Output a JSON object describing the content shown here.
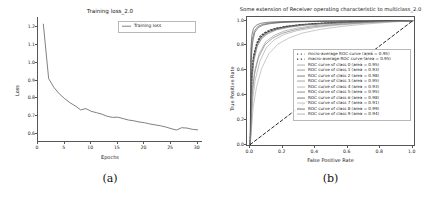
{
  "figure": {
    "panels": [
      {
        "caption": "(a)",
        "chart_data": {
          "type": "line",
          "title": "Training loss_2.0",
          "xlabel": "Epochs",
          "ylabel": "Loss",
          "xlim": [
            0,
            31
          ],
          "ylim": [
            0.55,
            1.25
          ],
          "xticks": [
            "0",
            "5",
            "10",
            "15",
            "20",
            "25",
            "30"
          ],
          "xtick_values": [
            0,
            5,
            10,
            15,
            20,
            25,
            30
          ],
          "yticks": [
            "0.6",
            "0.7",
            "0.8",
            "0.9",
            "1.0",
            "1.1",
            "1.2"
          ],
          "ytick_values": [
            0.6,
            0.7,
            0.8,
            0.9,
            1.0,
            1.1,
            1.2
          ],
          "grid": false,
          "legend_position": "upper right",
          "series": [
            {
              "name": "Training loss",
              "color": "#4a4a4a",
              "x": [
                1,
                2,
                3,
                4,
                5,
                6,
                7,
                8,
                9,
                10,
                11,
                12,
                13,
                14,
                15,
                16,
                17,
                18,
                19,
                20,
                21,
                22,
                23,
                24,
                25,
                26,
                27,
                28,
                29,
                30
              ],
              "values": [
                1.21,
                0.905,
                0.855,
                0.82,
                0.793,
                0.77,
                0.752,
                0.73,
                0.737,
                0.722,
                0.714,
                0.706,
                0.694,
                0.688,
                0.689,
                0.681,
                0.673,
                0.669,
                0.662,
                0.658,
                0.651,
                0.646,
                0.641,
                0.634,
                0.625,
                0.617,
                0.63,
                0.628,
                0.621,
                0.618
              ]
            }
          ]
        }
      },
      {
        "caption": "(b)",
        "chart_data": {
          "type": "line",
          "title": "Some extension of Receiver operating characteristic to multiclass_2.0",
          "xlabel": "False Positive Rate",
          "ylabel": "True Positive Rate",
          "xlim": [
            -0.02,
            1.02
          ],
          "ylim": [
            -0.02,
            1.03
          ],
          "xticks": [
            "0.0",
            "0.2",
            "0.4",
            "0.6",
            "0.8",
            "1.0"
          ],
          "xtick_values": [
            0.0,
            0.2,
            0.4,
            0.6,
            0.8,
            1.0
          ],
          "yticks": [
            "0.0",
            "0.2",
            "0.4",
            "0.6",
            "0.8",
            "1.0"
          ],
          "ytick_values": [
            0.0,
            0.2,
            0.4,
            0.6,
            0.8,
            1.0
          ],
          "grid": false,
          "legend_position": "lower right",
          "diagonal_reference": {
            "name": "chance-level-diagonal",
            "style": "dashed",
            "color": "#111111",
            "from": [
              0.0,
              0.0
            ],
            "to": [
              1.0,
              1.0
            ]
          },
          "series": [
            {
              "name": "micro-average ROC curve (area = 0.95)",
              "legend_style": "dotted",
              "color": "#555555",
              "x": [
                0.0,
                0.01,
                0.02,
                0.04,
                0.06,
                0.09,
                0.12,
                0.16,
                0.22,
                0.3,
                0.4,
                0.55,
                0.75,
                1.0
              ],
              "values": [
                0.0,
                0.58,
                0.72,
                0.82,
                0.875,
                0.905,
                0.925,
                0.94,
                0.955,
                0.968,
                0.978,
                0.988,
                0.995,
                1.0
              ]
            },
            {
              "name": "macro-average ROC curve (area = 0.95)",
              "legend_style": "dotted",
              "color": "#333333",
              "x": [
                0.0,
                0.01,
                0.02,
                0.04,
                0.06,
                0.09,
                0.12,
                0.16,
                0.22,
                0.3,
                0.4,
                0.55,
                0.75,
                1.0
              ],
              "values": [
                0.0,
                0.55,
                0.7,
                0.805,
                0.862,
                0.897,
                0.918,
                0.936,
                0.952,
                0.965,
                0.976,
                0.986,
                0.994,
                1.0
              ]
            },
            {
              "name": "ROC curve of class 0 (area = 0.95)",
              "legend_style": "solid",
              "color": "#8a8a8a",
              "x": [
                0.0,
                0.01,
                0.02,
                0.04,
                0.07,
                0.11,
                0.16,
                0.23,
                0.32,
                0.45,
                0.62,
                0.82,
                1.0
              ],
              "values": [
                0.0,
                0.5,
                0.66,
                0.79,
                0.855,
                0.895,
                0.925,
                0.945,
                0.963,
                0.976,
                0.987,
                0.995,
                1.0
              ]
            },
            {
              "name": "ROC curve of class 1 (area = 0.93)",
              "legend_style": "solid",
              "color": "#6e6e6e",
              "x": [
                0.0,
                0.012,
                0.025,
                0.05,
                0.09,
                0.14,
                0.2,
                0.28,
                0.38,
                0.52,
                0.68,
                0.85,
                1.0
              ],
              "values": [
                0.0,
                0.4,
                0.56,
                0.7,
                0.805,
                0.862,
                0.9,
                0.928,
                0.95,
                0.968,
                0.982,
                0.993,
                1.0
              ]
            },
            {
              "name": "ROC curve of class 2 (area = 0.98)",
              "legend_style": "solid",
              "color": "#4d4d4d",
              "x": [
                0.0,
                0.006,
                0.014,
                0.028,
                0.05,
                0.08,
                0.13,
                0.2,
                0.3,
                0.44,
                0.62,
                0.82,
                1.0
              ],
              "values": [
                0.0,
                0.68,
                0.82,
                0.905,
                0.945,
                0.965,
                0.978,
                0.986,
                0.991,
                0.995,
                0.997,
                0.999,
                1.0
              ]
            },
            {
              "name": "ROC curve of class 3 (area = 0.95)",
              "legend_style": "solid",
              "color": "#7d7d7d",
              "x": [
                0.0,
                0.01,
                0.022,
                0.045,
                0.075,
                0.115,
                0.17,
                0.24,
                0.34,
                0.47,
                0.64,
                0.83,
                1.0
              ],
              "values": [
                0.0,
                0.52,
                0.68,
                0.8,
                0.868,
                0.905,
                0.932,
                0.95,
                0.966,
                0.978,
                0.988,
                0.996,
                1.0
              ]
            },
            {
              "name": "ROC curve of class 4 (area = 0.93)",
              "legend_style": "solid",
              "color": "#9a9a9a",
              "x": [
                0.0,
                0.015,
                0.03,
                0.06,
                0.1,
                0.15,
                0.21,
                0.29,
                0.4,
                0.54,
                0.7,
                0.86,
                1.0
              ],
              "values": [
                0.0,
                0.36,
                0.52,
                0.675,
                0.785,
                0.848,
                0.89,
                0.921,
                0.945,
                0.965,
                0.98,
                0.992,
                1.0
              ]
            },
            {
              "name": "ROC curve of class 5 (area = 0.95)",
              "legend_style": "solid",
              "color": "#5c5c5c",
              "x": [
                0.0,
                0.009,
                0.02,
                0.042,
                0.072,
                0.112,
                0.165,
                0.235,
                0.33,
                0.46,
                0.63,
                0.83,
                1.0
              ],
              "values": [
                0.0,
                0.55,
                0.7,
                0.815,
                0.875,
                0.91,
                0.935,
                0.953,
                0.968,
                0.98,
                0.989,
                0.996,
                1.0
              ]
            },
            {
              "name": "ROC curve of class 6 (area = 0.98)",
              "legend_style": "solid",
              "color": "#454545",
              "x": [
                0.0,
                0.005,
                0.012,
                0.025,
                0.045,
                0.075,
                0.12,
                0.19,
                0.29,
                0.43,
                0.61,
                0.81,
                1.0
              ],
              "values": [
                0.0,
                0.72,
                0.845,
                0.915,
                0.952,
                0.97,
                0.981,
                0.988,
                0.993,
                0.996,
                0.998,
                0.999,
                1.0
              ]
            },
            {
              "name": "ROC curve of class 7 (area = 0.91)",
              "legend_style": "solid",
              "color": "#a5a5a5",
              "x": [
                0.0,
                0.018,
                0.038,
                0.07,
                0.115,
                0.17,
                0.24,
                0.32,
                0.43,
                0.57,
                0.72,
                0.87,
                1.0
              ],
              "values": [
                0.0,
                0.3,
                0.46,
                0.615,
                0.735,
                0.81,
                0.862,
                0.9,
                0.93,
                0.955,
                0.974,
                0.989,
                1.0
              ]
            },
            {
              "name": "ROC curve of class 8 (area = 0.99)",
              "legend_style": "solid",
              "color": "#3c3c3c",
              "x": [
                0.0,
                0.004,
                0.01,
                0.02,
                0.038,
                0.065,
                0.105,
                0.17,
                0.27,
                0.41,
                0.6,
                0.8,
                1.0
              ],
              "values": [
                0.0,
                0.78,
                0.885,
                0.938,
                0.965,
                0.979,
                0.987,
                0.992,
                0.995,
                0.997,
                0.999,
                0.999,
                1.0
              ]
            },
            {
              "name": "ROC curve of class 9 (area = 0.94)",
              "legend_style": "solid",
              "color": "#8f8f8f",
              "x": [
                0.0,
                0.013,
                0.028,
                0.055,
                0.095,
                0.145,
                0.205,
                0.285,
                0.39,
                0.53,
                0.69,
                0.86,
                1.0
              ],
              "values": [
                0.0,
                0.44,
                0.6,
                0.735,
                0.83,
                0.88,
                0.915,
                0.94,
                0.96,
                0.975,
                0.986,
                0.995,
                1.0
              ]
            }
          ]
        }
      }
    ]
  }
}
